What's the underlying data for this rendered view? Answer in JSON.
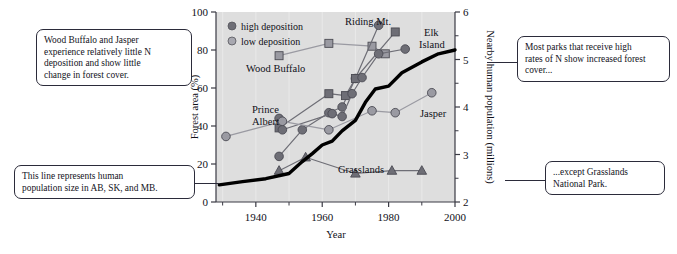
{
  "figure": {
    "title": "",
    "plot_background": "#dedede",
    "axis_color": "#3a3a44",
    "high_deposition_color": "#6e6e76",
    "low_deposition_color": "#9a9aa2",
    "population_line_color": "#000000"
  },
  "annotations": {
    "top_left": {
      "lines": [
        "Wood Buffalo and Jasper",
        "experience relatively little N",
        "deposition and show little",
        "change in forest cover."
      ]
    },
    "top_right": {
      "lines": [
        "Most parks that receive high",
        "rates of N show increased forest",
        "cover..."
      ]
    },
    "bottom_left": {
      "lines": [
        "This line represents human",
        "population size in AB, SK, and MB."
      ]
    },
    "bottom_right": {
      "lines": [
        "...except Grasslands",
        "National Park."
      ]
    }
  },
  "chart_data": {
    "type": "line",
    "title": "",
    "xlabel": "Year",
    "ylabel": "Forest area (%)",
    "y2label": "Nearby human population (millions)",
    "xlim": [
      1928,
      2000
    ],
    "ylim": [
      0,
      100
    ],
    "y2lim": [
      2,
      6
    ],
    "xticks": [
      1940,
      1960,
      1980,
      2000
    ],
    "xticks_minor": [
      1930,
      1950,
      1970,
      1990
    ],
    "yticks": [
      0,
      20,
      40,
      60,
      80,
      100
    ],
    "y2ticks": [
      2,
      3,
      4,
      5,
      6
    ],
    "y2ticks_minor": [
      2.5,
      3.5,
      4.5,
      5.5
    ],
    "grid": "light vertical gridlines on shaded panel",
    "legend": {
      "position": "top-left inside panel",
      "entries": [
        {
          "label": "high deposition",
          "marker": "filled-circle",
          "color": "#6e6e76"
        },
        {
          "label": "low deposition",
          "marker": "open-circle",
          "color": "#9a9aa2"
        }
      ]
    },
    "series": [
      {
        "name": "Wood Buffalo",
        "deposition": "low",
        "marker": "square",
        "color": "#9a9aa2",
        "label_position": "below-left of line",
        "points": [
          {
            "x": 1947,
            "y": 77
          },
          {
            "x": 1962,
            "y": 83.5
          },
          {
            "x": 1975,
            "y": 82
          },
          {
            "x": 1979,
            "y": 78
          }
        ]
      },
      {
        "name": "Riding Mt.",
        "deposition": "high",
        "marker": "circle",
        "color": "#6e6e76",
        "label_position": "above series peak",
        "points": [
          {
            "x": 1947,
            "y": 24
          },
          {
            "x": 1954,
            "y": 38
          },
          {
            "x": 1962,
            "y": 47
          },
          {
            "x": 1966,
            "y": 50
          },
          {
            "x": 1970,
            "y": 65
          },
          {
            "x": 1977,
            "y": 93
          }
        ]
      },
      {
        "name": "Elk Island",
        "deposition": "high",
        "marker": "square",
        "color": "#6e6e76",
        "label_position": "right of series end",
        "points": [
          {
            "x": 1947,
            "y": 39
          },
          {
            "x": 1962,
            "y": 57
          },
          {
            "x": 1967,
            "y": 56
          },
          {
            "x": 1970,
            "y": 65
          },
          {
            "x": 1982,
            "y": 89.5
          }
        ]
      },
      {
        "name": "Prince Albert",
        "deposition": "high",
        "marker": "circle",
        "color": "#6e6e76",
        "label_position": "left of series start",
        "points": [
          {
            "x": 1947,
            "y": 44
          },
          {
            "x": 1948,
            "y": 38
          },
          {
            "x": 1963,
            "y": 46.5
          },
          {
            "x": 1966,
            "y": 45
          },
          {
            "x": 1969,
            "y": 57
          },
          {
            "x": 1972,
            "y": 65.5
          },
          {
            "x": 1977,
            "y": 78
          },
          {
            "x": 1985,
            "y": 80.5
          }
        ]
      },
      {
        "name": "Jasper",
        "deposition": "low",
        "marker": "circle",
        "color": "#9a9aa2",
        "label_position": "right of series end",
        "points": [
          {
            "x": 1931,
            "y": 34.5
          },
          {
            "x": 1948,
            "y": 42.5
          },
          {
            "x": 1962,
            "y": 38
          },
          {
            "x": 1975,
            "y": 48
          },
          {
            "x": 1982,
            "y": 47
          },
          {
            "x": 1993,
            "y": 57.5
          }
        ]
      },
      {
        "name": "Grasslands",
        "deposition": "high",
        "marker": "triangle",
        "color": "#6e6e76",
        "label_position": "above mid series",
        "points": [
          {
            "x": 1947,
            "y": 16.5
          },
          {
            "x": 1955,
            "y": 23.5
          },
          {
            "x": 1970,
            "y": 15
          },
          {
            "x": 1981,
            "y": 16.5
          },
          {
            "x": 1990,
            "y": 16.5
          }
        ]
      },
      {
        "name": "Nearby human population (millions)",
        "axis": "right",
        "marker": "none",
        "color": "#000000",
        "line_weight": "thick",
        "points": [
          {
            "x": 1929,
            "y2": 2.36
          },
          {
            "x": 1936,
            "y2": 2.43
          },
          {
            "x": 1943,
            "y2": 2.49
          },
          {
            "x": 1950,
            "y2": 2.6
          },
          {
            "x": 1954,
            "y2": 2.85
          },
          {
            "x": 1957,
            "y2": 3.02
          },
          {
            "x": 1960,
            "y2": 3.2
          },
          {
            "x": 1963,
            "y2": 3.28
          },
          {
            "x": 1966,
            "y2": 3.5
          },
          {
            "x": 1970,
            "y2": 3.72
          },
          {
            "x": 1973,
            "y2": 4.1
          },
          {
            "x": 1976,
            "y2": 4.38
          },
          {
            "x": 1980,
            "y2": 4.44
          },
          {
            "x": 1984,
            "y2": 4.72
          },
          {
            "x": 1990,
            "y2": 4.95
          },
          {
            "x": 1995,
            "y2": 5.12
          },
          {
            "x": 2000,
            "y2": 5.2
          }
        ]
      }
    ]
  }
}
